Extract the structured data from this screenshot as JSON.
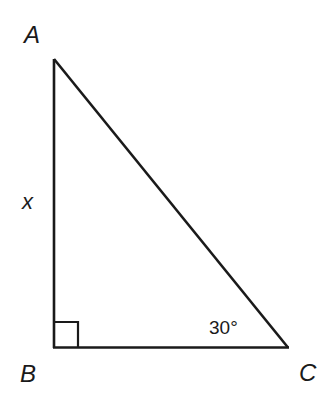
{
  "diagram": {
    "type": "right-triangle",
    "stroke_color": "#1a1a1a",
    "vertices": [
      {
        "name": "A",
        "label": "A"
      },
      {
        "name": "B",
        "label": "B"
      },
      {
        "name": "C",
        "label": "C"
      }
    ],
    "sides": [
      {
        "between": "AB",
        "label": "x"
      }
    ],
    "angles": [
      {
        "at": "B",
        "kind": "right-angle-marker"
      },
      {
        "at": "C",
        "label": "30°"
      }
    ]
  }
}
